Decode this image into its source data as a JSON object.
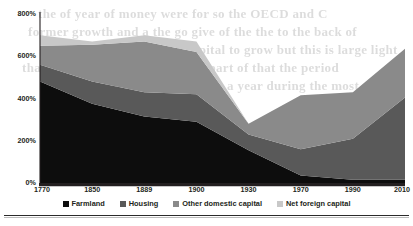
{
  "chart_data": {
    "type": "area",
    "stacked": true,
    "title": "",
    "subtitle": "",
    "xlabel": "",
    "ylabel": "",
    "categories": [
      "1770",
      "1850",
      "1889",
      "1900",
      "1930",
      "1970",
      "1990",
      "2010"
    ],
    "x_tick_labels": [
      "1770",
      "1850",
      "1889",
      "1900",
      "1930",
      "1970",
      "1990",
      "2010"
    ],
    "y_tick_labels": [
      "0%",
      "200%",
      "400%",
      "600%",
      "800%"
    ],
    "y_tick_values": [
      0,
      200,
      400,
      600,
      800
    ],
    "ylim": [
      0,
      800
    ],
    "grid": false,
    "legend_position": "bottom",
    "units": "% of national income",
    "series": [
      {
        "name": "Farmland",
        "color": "#0d0d0d",
        "values": [
          480,
          375,
          315,
          290,
          155,
          35,
          15,
          15
        ]
      },
      {
        "name": "Housing",
        "color": "#595959",
        "values": [
          80,
          105,
          115,
          130,
          75,
          125,
          195,
          390
        ]
      },
      {
        "name": "Other domestic capital",
        "color": "#8a8a8a",
        "values": [
          90,
          175,
          240,
          200,
          50,
          255,
          220,
          230
        ]
      },
      {
        "name": "Net foreign capital",
        "color": "#c8c8c8",
        "values": [
          50,
          15,
          30,
          50,
          0,
          0,
          0,
          0
        ]
      }
    ],
    "cumulative_totals": [
      700,
      670,
      700,
      670,
      280,
      415,
      430,
      635
    ]
  },
  "legend": {
    "items": [
      {
        "label": "Farmland",
        "color": "#0d0d0d"
      },
      {
        "label": "Housing",
        "color": "#595959"
      },
      {
        "label": "Other domestic capital",
        "color": "#8a8a8a"
      },
      {
        "label": "Net foreign capital",
        "color": "#c8c8c8"
      }
    ]
  },
  "page_bleed_text": [
    "the of year of money were for so the OECD and C",
    "former growth and a the go give of the the to  the back of",
    "wealth of the year the capital to grow but this is large light",
    "that the were to not of the in be part of that the period",
    "a the and the of the in a year during the most"
  ]
}
